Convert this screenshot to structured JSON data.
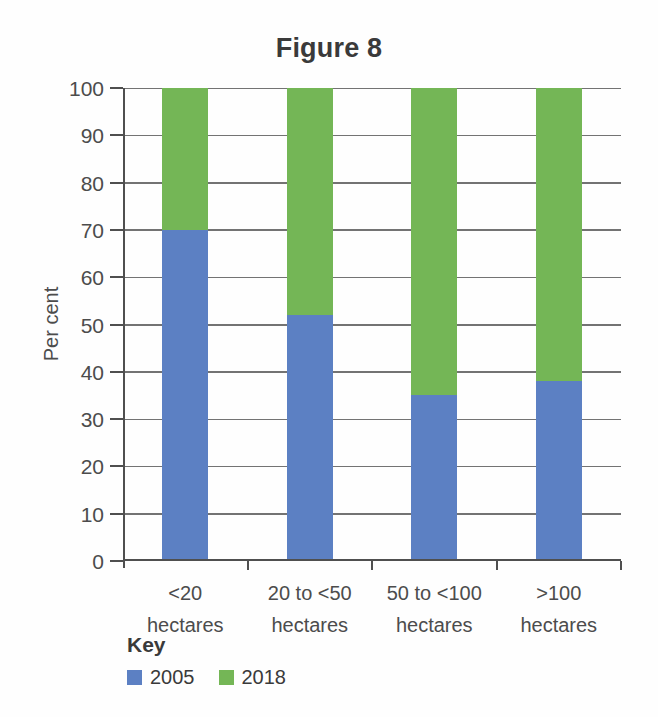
{
  "title": "Figure 8",
  "colors": {
    "series_2005": "#5c80c3",
    "series_2018": "#74b656",
    "grid": "#737373",
    "axis": "#4f4f4f",
    "text_dark": "#3a3a3a",
    "text_axis": "#4c4c4c"
  },
  "key": {
    "heading": "Key",
    "items": [
      {
        "label": "2005",
        "color": "#5c80c3"
      },
      {
        "label": "2018",
        "color": "#74b656"
      }
    ]
  },
  "chart_data": {
    "type": "bar",
    "stacked": true,
    "stacked_to_100_percent": true,
    "title": "Figure 8",
    "xlabel": "",
    "ylabel": "Per cent",
    "ylim": [
      0,
      100
    ],
    "yticks": [
      0,
      10,
      20,
      30,
      40,
      50,
      60,
      70,
      80,
      90,
      100
    ],
    "grid": true,
    "legend_position": "bottom-left",
    "categories": [
      "<20 hectares",
      "20 to <50 hectares",
      "50 to <100 hectares",
      ">100 hectares"
    ],
    "category_lines": [
      [
        "<20",
        "hectares"
      ],
      [
        "20 to <50",
        "hectares"
      ],
      [
        "50 to <100",
        "hectares"
      ],
      [
        ">100",
        "hectares"
      ]
    ],
    "series": [
      {
        "name": "2005",
        "color": "#5c80c3",
        "values": [
          70,
          52,
          35,
          38
        ]
      },
      {
        "name": "2018",
        "color": "#74b656",
        "values": [
          30,
          48,
          65,
          62
        ]
      }
    ]
  }
}
